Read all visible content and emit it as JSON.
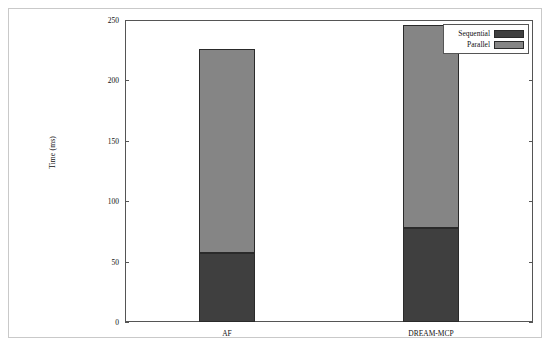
{
  "chart_data": {
    "type": "bar",
    "subtype": "stacked-vertical",
    "title": "",
    "xlabel": "",
    "ylabel": "Time (ms)",
    "categories": [
      "AF",
      "DREAM-MCP"
    ],
    "series": [
      {
        "name": "Sequential",
        "values": [
          57,
          78
        ],
        "color": "#3f3f3f"
      },
      {
        "name": "Parallel",
        "values": [
          169,
          168
        ],
        "color": "#858585"
      }
    ],
    "totals": [
      226,
      246
    ],
    "ylim": [
      0,
      250
    ],
    "yticks": [
      0,
      50,
      100,
      150,
      200,
      250
    ],
    "ytick_labels": [
      "0",
      "50",
      "100",
      "150",
      "200",
      "250"
    ],
    "grid": false,
    "legend_position": "top-right",
    "frame": true,
    "ticks_both_sides": true
  },
  "legend": {
    "entries": [
      {
        "label": "Sequential",
        "color": "#3f3f3f"
      },
      {
        "label": "Parallel",
        "color": "#858585"
      }
    ]
  },
  "axes": {
    "y_label": "Time (ms)",
    "y_ticks": [
      "0",
      "50",
      "100",
      "150",
      "200",
      "250"
    ],
    "x_ticks": [
      "AF",
      "DREAM-MCP"
    ]
  },
  "colors": {
    "sequential": "#3f3f3f",
    "parallel": "#858585",
    "frame": "#555555",
    "page_border": "#c9c9c9",
    "background": "#ffffff"
  }
}
